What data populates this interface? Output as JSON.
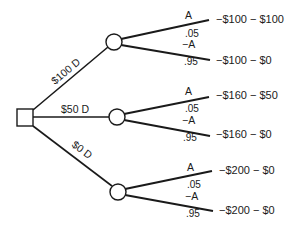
{
  "diagram": {
    "type": "decision-tree",
    "decision_node": {
      "shape": "square"
    },
    "decisions": [
      {
        "label": "$100 D",
        "branches": [
          {
            "event": "A",
            "probability": ".05",
            "outcome": "−$100 − $100"
          },
          {
            "event": "−A",
            "probability": ".95",
            "outcome": "−$100 − $0"
          }
        ]
      },
      {
        "label": "$50 D",
        "branches": [
          {
            "event": "A",
            "probability": ".05",
            "outcome": "−$160 − $50"
          },
          {
            "event": "−A",
            "probability": ".95",
            "outcome": "−$160 − $0"
          }
        ]
      },
      {
        "label": "$0 D",
        "branches": [
          {
            "event": "A",
            "probability": ".05",
            "outcome": "−$200 − $0"
          },
          {
            "event": "−A",
            "probability": ".95",
            "outcome": "−$200 − $0"
          }
        ]
      }
    ]
  },
  "colors": {
    "ink": "#1a1a1a",
    "background": "#ffffff"
  }
}
